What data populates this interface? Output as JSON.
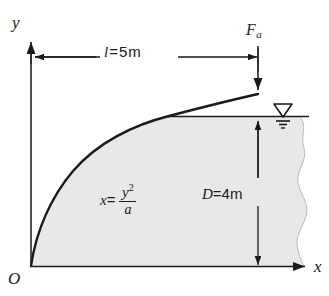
{
  "figure": {
    "background_color": "#ffffff",
    "line_color": "#1a1a1a",
    "fill_color": "#e8e8e8"
  },
  "axes": {
    "y_label": "y",
    "x_label": "x",
    "origin_label": "O"
  },
  "force": {
    "symbol": "F",
    "subscript": "a",
    "label": "F"
  },
  "dimensions": {
    "length": {
      "symbol": "l",
      "equals": "=",
      "value": "5",
      "unit": "m",
      "text": "l = 5 m"
    },
    "depth": {
      "symbol": "D",
      "equals": "=",
      "value": "4",
      "unit": "m",
      "text": "D = 4 m"
    }
  },
  "equation": {
    "lhs": "x",
    "equals": "=",
    "numerator_base": "y",
    "numerator_exponent": "2",
    "denominator": "a",
    "text": "x = y2/a"
  },
  "symbols": {
    "water_table": "water-level-triangle"
  }
}
